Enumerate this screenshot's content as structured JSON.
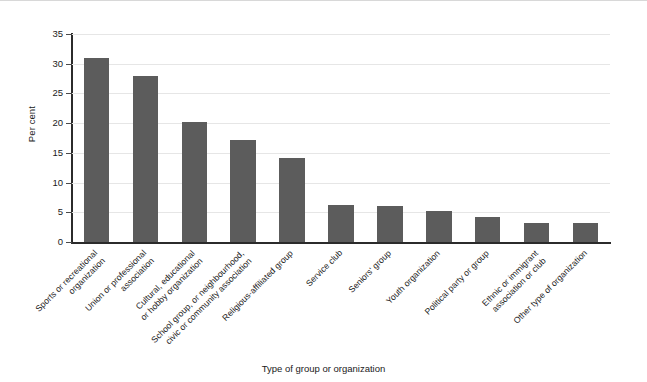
{
  "chart_data": {
    "type": "bar",
    "title": "",
    "subtitle": "",
    "xlabel": "Type of group or organization",
    "ylabel": "Per cent",
    "ylim": [
      0,
      35
    ],
    "ytick_values": [
      0,
      5,
      10,
      15,
      20,
      25,
      30,
      35
    ],
    "ytick_labels": [
      "0",
      "5",
      "10",
      "15",
      "20",
      "25",
      "30",
      "35"
    ],
    "grid": "horizontal",
    "legend": "none",
    "bar_color": "#5c5c5c",
    "categories": [
      "Sports or recreational organization",
      "Union or professional association",
      "Cultural, educational or hobby organization",
      "School group, or neighbourhood, civic or community association",
      "Religious-affiliated group",
      "Service club",
      "Seniors' group",
      "Youth organization",
      "Political party or group",
      "Ethnic or immigrant association or club",
      "Other type of organization"
    ],
    "category_lines": [
      [
        "Sports or recreational",
        "organization"
      ],
      [
        "Union or professional",
        "association"
      ],
      [
        "Cultural, educational",
        "or hobby organization"
      ],
      [
        "School group, or neighbourhood,",
        "civic or community association"
      ],
      [
        "Religious-affiliated group",
        ""
      ],
      [
        "Service club",
        ""
      ],
      [
        "Seniors' group",
        ""
      ],
      [
        "Youth organization",
        ""
      ],
      [
        "Political party or group",
        ""
      ],
      [
        "Ethnic or immigrant",
        "association or club"
      ],
      [
        "Other type of organization",
        ""
      ]
    ],
    "values": [
      31.0,
      28.0,
      20.2,
      17.2,
      14.2,
      6.2,
      6.1,
      5.2,
      4.2,
      3.2,
      3.2
    ]
  }
}
